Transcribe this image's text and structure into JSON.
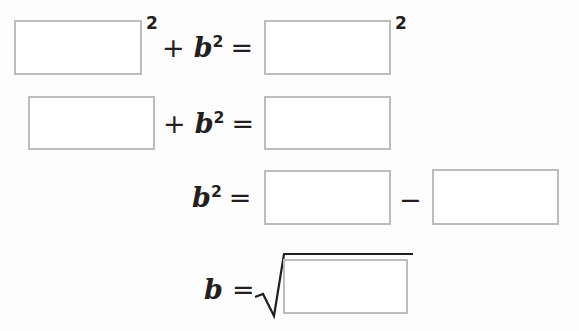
{
  "document": {
    "type": "math-worksheet",
    "subject": "Pythagorean theorem — solve for b",
    "background_color": "#fdfdfd",
    "box_border_color": "#bdbdbd",
    "text_color": "#231f20"
  },
  "equations": [
    {
      "id": "line-1",
      "expression": "□² + b² = □²",
      "parts": {
        "plus": "+",
        "variable_b": "b",
        "exponent": "2",
        "equals": "=",
        "blank_1_exponent": "2",
        "blank_2_exponent": "2"
      },
      "blanks": [
        {
          "name": "line1-blank-left",
          "value": "",
          "placeholder": ""
        },
        {
          "name": "line1-blank-right",
          "value": "",
          "placeholder": ""
        }
      ]
    },
    {
      "id": "line-2",
      "expression": "□ + b² = □",
      "parts": {
        "plus": "+",
        "variable_b": "b",
        "exponent": "2",
        "equals": "="
      },
      "blanks": [
        {
          "name": "line2-blank-left",
          "value": "",
          "placeholder": ""
        },
        {
          "name": "line2-blank-right",
          "value": "",
          "placeholder": ""
        }
      ]
    },
    {
      "id": "line-3",
      "expression": "b² = □ − □",
      "parts": {
        "variable_b": "b",
        "exponent": "2",
        "equals": "=",
        "minus": "−"
      },
      "blanks": [
        {
          "name": "line3-blank-left",
          "value": "",
          "placeholder": ""
        },
        {
          "name": "line3-blank-right",
          "value": "",
          "placeholder": ""
        }
      ]
    },
    {
      "id": "line-4",
      "expression": "b = √□",
      "parts": {
        "variable_b": "b",
        "equals": "=",
        "radical": "√"
      },
      "blanks": [
        {
          "name": "line4-blank-radicand",
          "value": "",
          "placeholder": ""
        }
      ]
    }
  ]
}
